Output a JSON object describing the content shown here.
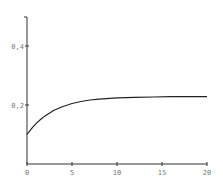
{
  "chart_data": {
    "type": "line",
    "title": "",
    "xlabel": "",
    "ylabel": "",
    "xlim": [
      0,
      20
    ],
    "ylim": [
      0,
      0.5
    ],
    "grid": false,
    "legend": null,
    "x_ticks": [
      0,
      5,
      10,
      15,
      20
    ],
    "x_tick_labels": [
      "0",
      "5",
      "10",
      "15",
      "20"
    ],
    "y_ticks": [
      0.2,
      0.4
    ],
    "y_tick_labels": [
      "0,2",
      "0,4"
    ],
    "series": [
      {
        "name": "curve",
        "color": "#222222",
        "x": [
          0,
          0.5,
          1,
          1.5,
          2,
          3,
          4,
          5,
          6,
          7,
          8,
          10,
          12,
          14,
          16,
          18,
          20
        ],
        "values": [
          0.1,
          0.12,
          0.137,
          0.151,
          0.163,
          0.182,
          0.195,
          0.205,
          0.212,
          0.217,
          0.22,
          0.224,
          0.226,
          0.227,
          0.228,
          0.228,
          0.228
        ]
      }
    ]
  },
  "colors": {
    "axis": "#333333",
    "line": "#222222",
    "label": "#777777"
  }
}
